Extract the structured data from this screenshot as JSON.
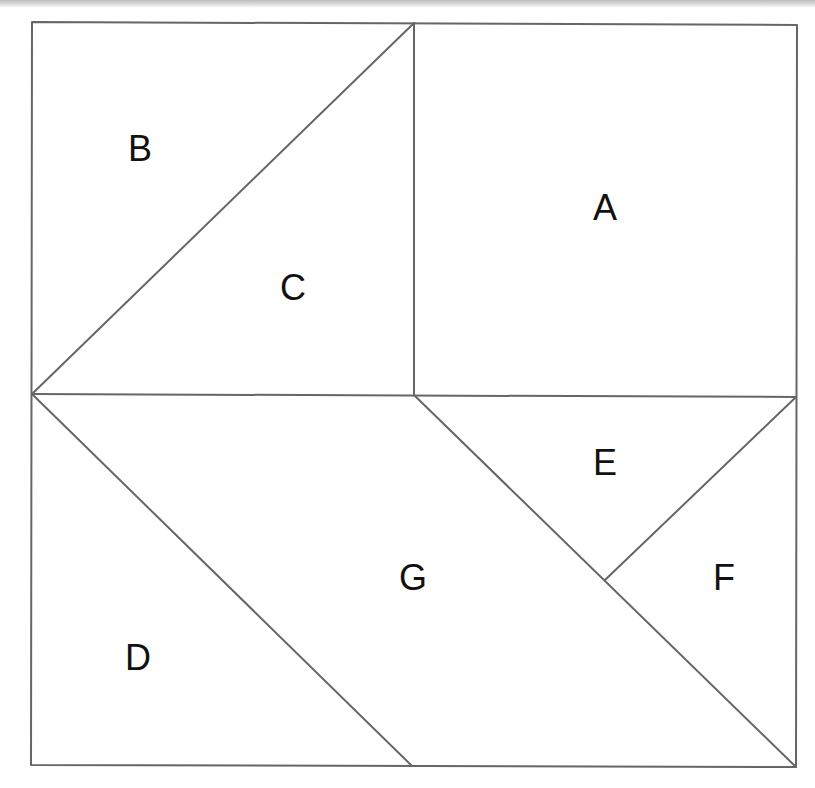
{
  "diagram": {
    "type": "tangram-square-dissection",
    "stroke_color": "#666666",
    "background": "#ffffff",
    "pieces": [
      {
        "id": "A",
        "label": "A",
        "shape": "square",
        "points": [
          [
            414,
            23
          ],
          [
            797,
            25
          ],
          [
            796,
            397
          ],
          [
            414,
            395
          ]
        ],
        "label_pos": [
          605,
          208
        ]
      },
      {
        "id": "B",
        "label": "B",
        "shape": "triangle",
        "points": [
          [
            32,
            22
          ],
          [
            414,
            23
          ],
          [
            32,
            394
          ]
        ],
        "label_pos": [
          140,
          149
        ]
      },
      {
        "id": "C",
        "label": "C",
        "shape": "triangle",
        "points": [
          [
            414,
            23
          ],
          [
            414,
            395
          ],
          [
            32,
            394
          ]
        ],
        "label_pos": [
          293,
          288
        ]
      },
      {
        "id": "D",
        "label": "D",
        "shape": "triangle",
        "points": [
          [
            32,
            394
          ],
          [
            411,
            765
          ],
          [
            31,
            765
          ]
        ],
        "label_pos": [
          138,
          658
        ]
      },
      {
        "id": "E",
        "label": "E",
        "shape": "triangle",
        "points": [
          [
            414,
            395
          ],
          [
            796,
            397
          ],
          [
            605,
            580
          ]
        ],
        "label_pos": [
          605,
          463
        ]
      },
      {
        "id": "F",
        "label": "F",
        "shape": "triangle",
        "points": [
          [
            796,
            397
          ],
          [
            796,
            767
          ],
          [
            605,
            580
          ]
        ],
        "label_pos": [
          724,
          578
        ]
      },
      {
        "id": "G",
        "label": "G",
        "shape": "parallelogram",
        "points": [
          [
            32,
            394
          ],
          [
            414,
            395
          ],
          [
            796,
            767
          ],
          [
            411,
            765
          ]
        ],
        "label_pos": [
          413,
          578
        ]
      }
    ]
  }
}
